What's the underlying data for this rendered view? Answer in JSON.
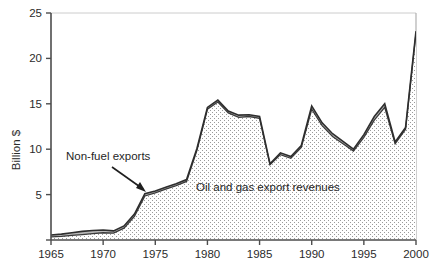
{
  "chart_data": {
    "type": "area",
    "title": "",
    "subtitle": "",
    "xlabel": "",
    "ylabel": "Billion $",
    "xlim": [
      1965,
      2000
    ],
    "ylim": [
      0,
      25
    ],
    "grid": false,
    "legend_position": "none",
    "x_ticks": [
      "1965",
      "1970",
      "1975",
      "1980",
      "1985",
      "1990",
      "1995",
      "2000"
    ],
    "x_tick_values": [
      1965,
      1970,
      1975,
      1980,
      1985,
      1990,
      1995,
      2000
    ],
    "y_ticks": [
      "5",
      "10",
      "15",
      "20",
      "25"
    ],
    "y_tick_values": [
      5,
      10,
      15,
      20,
      25
    ],
    "x": [
      1965,
      1966,
      1967,
      1968,
      1969,
      1970,
      1971,
      1972,
      1973,
      1974,
      1975,
      1976,
      1977,
      1978,
      1979,
      1980,
      1981,
      1982,
      1983,
      1984,
      1985,
      1986,
      1987,
      1988,
      1989,
      1990,
      1991,
      1992,
      1993,
      1994,
      1995,
      1996,
      1997,
      1998,
      1999,
      2000
    ],
    "series": [
      {
        "name": "Oil and gas export revenues",
        "fill": "stipple",
        "values": [
          0.35,
          0.4,
          0.5,
          0.6,
          0.7,
          0.8,
          0.75,
          1.3,
          2.6,
          4.85,
          5.2,
          5.6,
          6.0,
          6.45,
          9.9,
          14.4,
          15.2,
          14.0,
          13.5,
          13.6,
          13.4,
          8.3,
          9.4,
          9.0,
          10.2,
          14.4,
          12.6,
          11.4,
          10.6,
          9.8,
          11.3,
          13.2,
          14.6,
          10.6,
          12.2,
          22.8
        ]
      },
      {
        "name": "Non-fuel exports",
        "fill": "gray-band",
        "values": [
          0.55,
          0.65,
          0.8,
          0.95,
          1.05,
          1.1,
          1.0,
          1.55,
          2.85,
          5.1,
          5.4,
          5.8,
          6.2,
          6.65,
          10.1,
          14.6,
          15.4,
          14.2,
          13.75,
          13.8,
          13.6,
          8.4,
          9.6,
          9.2,
          10.4,
          14.75,
          12.9,
          11.7,
          10.85,
          10.0,
          11.6,
          13.6,
          15.0,
          10.8,
          12.4,
          23.0
        ]
      }
    ],
    "annotations": [
      {
        "name": "non-fuel-exports-label",
        "text": "Non-fuel exports",
        "x_px": 66,
        "y_px": 160,
        "arrow": {
          "from_x_px": 112,
          "from_y_px": 167,
          "to_x_px": 146,
          "to_y_px": 192
        }
      },
      {
        "name": "oil-gas-label",
        "text": "Oil and gas export revenues",
        "x_px": 196,
        "y_px": 191
      }
    ],
    "colors": {
      "axis": "#4d4d4d",
      "line": "#333333",
      "band_fill": "#b8b8b8",
      "area_fill": "#ffffff",
      "stipple_dot": "#8a8a8a",
      "text": "#2b2b2b",
      "plot_border": "#b0b0b0"
    }
  }
}
